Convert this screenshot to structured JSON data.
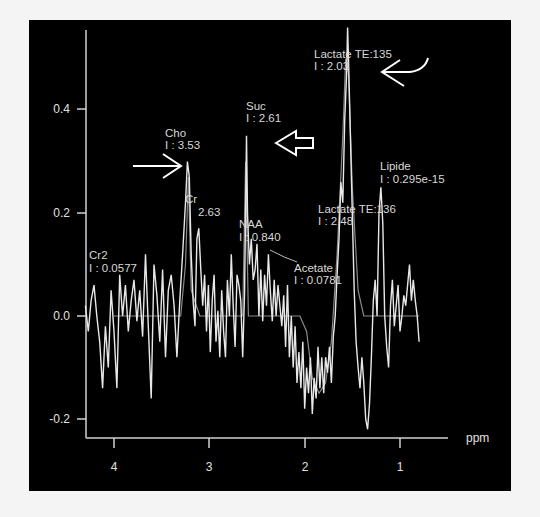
{
  "chart_data": {
    "type": "line",
    "title": "",
    "xlabel": "ppm",
    "ylabel": "",
    "x_reversed": true,
    "xlim": [
      4.3,
      0.5
    ],
    "ylim": [
      -0.24,
      0.55
    ],
    "grid": false,
    "xticks": [
      4,
      3,
      2,
      1
    ],
    "yticks": [
      0.4,
      0.2,
      0.0,
      -0.2
    ],
    "ytick_labels": [
      "0.4",
      "0.2",
      "0.0",
      "-0.2"
    ],
    "xtick_labels": [
      "4",
      "3",
      "2",
      "1"
    ],
    "series": [
      {
        "name": "measured spectrum",
        "color": "#e8e8e8",
        "points": [
          [
            4.3,
            0.02
          ],
          [
            4.27,
            -0.03
          ],
          [
            4.24,
            0.03
          ],
          [
            4.21,
            0.06
          ],
          [
            4.18,
            0.0
          ],
          [
            4.15,
            -0.05
          ],
          [
            4.12,
            -0.14
          ],
          [
            4.09,
            -0.02
          ],
          [
            4.06,
            -0.1
          ],
          [
            4.03,
            0.05
          ],
          [
            4.0,
            -0.03
          ],
          [
            3.97,
            -0.14
          ],
          [
            3.94,
            0.08
          ],
          [
            3.91,
            0.0
          ],
          [
            3.88,
            0.06
          ],
          [
            3.85,
            -0.03
          ],
          [
            3.82,
            0.03
          ],
          [
            3.79,
            0.07
          ],
          [
            3.76,
            -0.01
          ],
          [
            3.73,
            0.05
          ],
          [
            3.7,
            -0.04
          ],
          [
            3.67,
            0.12
          ],
          [
            3.64,
            -0.02
          ],
          [
            3.61,
            -0.16
          ],
          [
            3.58,
            0.1
          ],
          [
            3.55,
            0.04
          ],
          [
            3.52,
            -0.05
          ],
          [
            3.49,
            0.09
          ],
          [
            3.46,
            -0.08
          ],
          [
            3.43,
            0.05
          ],
          [
            3.4,
            0.08
          ],
          [
            3.37,
            0.02
          ],
          [
            3.34,
            -0.08
          ],
          [
            3.31,
            0.03
          ],
          [
            3.28,
            0.12
          ],
          [
            3.25,
            0.22
          ],
          [
            3.23,
            0.3
          ],
          [
            3.21,
            0.27
          ],
          [
            3.19,
            0.12
          ],
          [
            3.17,
            0.03
          ],
          [
            3.15,
            -0.02
          ],
          [
            3.13,
            0.15
          ],
          [
            3.11,
            0.17
          ],
          [
            3.09,
            0.09
          ],
          [
            3.07,
            0.02
          ],
          [
            3.05,
            0.08
          ],
          [
            3.03,
            -0.03
          ],
          [
            3.01,
            0.06
          ],
          [
            2.99,
            -0.07
          ],
          [
            2.97,
            0.03
          ],
          [
            2.95,
            0.08
          ],
          [
            2.93,
            -0.05
          ],
          [
            2.91,
            0.01
          ],
          [
            2.89,
            -0.08
          ],
          [
            2.87,
            0.05
          ],
          [
            2.85,
            -0.03
          ],
          [
            2.83,
            -0.08
          ],
          [
            2.81,
            0.07
          ],
          [
            2.79,
            0.0
          ],
          [
            2.77,
            0.12
          ],
          [
            2.75,
            0.02
          ],
          [
            2.73,
            -0.06
          ],
          [
            2.71,
            0.08
          ],
          [
            2.69,
            0.06
          ],
          [
            2.67,
            0.03
          ],
          [
            2.65,
            -0.08
          ],
          [
            2.63,
            0.05
          ],
          [
            2.61,
            0.35
          ],
          [
            2.6,
            0.2
          ],
          [
            2.58,
            0.1
          ],
          [
            2.56,
            0.15
          ],
          [
            2.54,
            0.07
          ],
          [
            2.52,
            0.09
          ],
          [
            2.5,
            0.14
          ],
          [
            2.48,
            0.0
          ],
          [
            2.46,
            0.09
          ],
          [
            2.44,
            -0.01
          ],
          [
            2.42,
            0.08
          ],
          [
            2.4,
            0.02
          ],
          [
            2.38,
            0.12
          ],
          [
            2.36,
            0.05
          ],
          [
            2.34,
            -0.01
          ],
          [
            2.32,
            0.07
          ],
          [
            2.3,
            0.0
          ],
          [
            2.28,
            0.06
          ],
          [
            2.26,
            0.02
          ],
          [
            2.24,
            -0.02
          ],
          [
            2.22,
            0.04
          ],
          [
            2.2,
            -0.06
          ],
          [
            2.18,
            0.06
          ],
          [
            2.16,
            -0.08
          ],
          [
            2.14,
            0.0
          ],
          [
            2.12,
            -0.1
          ],
          [
            2.1,
            -0.02
          ],
          [
            2.08,
            -0.13
          ],
          [
            2.06,
            -0.07
          ],
          [
            2.04,
            -0.14
          ],
          [
            2.02,
            -0.05
          ],
          [
            2.0,
            -0.18
          ],
          [
            1.98,
            -0.1
          ],
          [
            1.96,
            -0.15
          ],
          [
            1.94,
            -0.08
          ],
          [
            1.92,
            -0.19
          ],
          [
            1.9,
            -0.12
          ],
          [
            1.88,
            -0.16
          ],
          [
            1.86,
            -0.06
          ],
          [
            1.84,
            -0.14
          ],
          [
            1.82,
            -0.08
          ],
          [
            1.8,
            -0.15
          ],
          [
            1.78,
            -0.08
          ],
          [
            1.76,
            -0.11
          ],
          [
            1.74,
            -0.06
          ],
          [
            1.72,
            -0.13
          ],
          [
            1.7,
            -0.04
          ],
          [
            1.68,
            0.0
          ],
          [
            1.66,
            0.08
          ],
          [
            1.64,
            0.15
          ],
          [
            1.62,
            0.26
          ],
          [
            1.6,
            0.22
          ],
          [
            1.58,
            0.38
          ],
          [
            1.56,
            0.47
          ],
          [
            1.55,
            0.56
          ],
          [
            1.54,
            0.5
          ],
          [
            1.52,
            0.35
          ],
          [
            1.5,
            0.2
          ],
          [
            1.48,
            0.05
          ],
          [
            1.46,
            -0.05
          ],
          [
            1.44,
            -0.1
          ],
          [
            1.42,
            -0.14
          ],
          [
            1.4,
            -0.08
          ],
          [
            1.38,
            -0.13
          ],
          [
            1.36,
            -0.2
          ],
          [
            1.34,
            -0.22
          ],
          [
            1.32,
            -0.17
          ],
          [
            1.3,
            -0.08
          ],
          [
            1.28,
            0.03
          ],
          [
            1.26,
            0.07
          ],
          [
            1.24,
            0.0
          ],
          [
            1.22,
            0.2
          ],
          [
            1.2,
            0.25
          ],
          [
            1.18,
            0.18
          ],
          [
            1.16,
            0.0
          ],
          [
            1.14,
            -0.06
          ],
          [
            1.12,
            -0.1
          ],
          [
            1.1,
            0.02
          ],
          [
            1.08,
            0.07
          ],
          [
            1.06,
            -0.02
          ],
          [
            1.04,
            0.02
          ],
          [
            1.02,
            0.06
          ],
          [
            1.0,
            -0.03
          ],
          [
            0.98,
            0.0
          ],
          [
            0.96,
            0.04
          ],
          [
            0.94,
            0.02
          ],
          [
            0.92,
            0.06
          ],
          [
            0.9,
            0.1
          ],
          [
            0.88,
            0.03
          ],
          [
            0.86,
            0.07
          ],
          [
            0.84,
            0.03
          ],
          [
            0.82,
            0.0
          ],
          [
            0.8,
            -0.05
          ]
        ]
      },
      {
        "name": "fitted baseline",
        "color": "#8a8a8a",
        "points": [
          [
            4.0,
            0.0
          ],
          [
            3.3,
            0.0
          ],
          [
            3.25,
            0.1
          ],
          [
            3.22,
            0.27
          ],
          [
            3.19,
            0.05
          ],
          [
            3.1,
            0.0
          ],
          [
            2.65,
            0.0
          ],
          [
            2.62,
            0.3
          ],
          [
            2.59,
            0.0
          ],
          [
            2.3,
            0.0
          ],
          [
            2.05,
            0.0
          ],
          [
            1.98,
            -0.03
          ],
          [
            1.92,
            -0.12
          ],
          [
            1.85,
            -0.15
          ],
          [
            1.78,
            -0.13
          ],
          [
            1.72,
            -0.05
          ],
          [
            1.66,
            0.12
          ],
          [
            1.6,
            0.35
          ],
          [
            1.57,
            0.5
          ],
          [
            1.54,
            0.47
          ],
          [
            1.5,
            0.25
          ],
          [
            1.44,
            0.05
          ],
          [
            1.38,
            0.0
          ],
          [
            0.8,
            0.0
          ]
        ]
      }
    ],
    "annotations": [
      {
        "name": "Cho",
        "value": "I : 3.53",
        "ppm": 3.22
      },
      {
        "name": "Cr",
        "value": "2.63",
        "ppm": 3.15
      },
      {
        "name": "Cr2",
        "value": "I : 0.0577",
        "ppm": 4.2
      },
      {
        "name": "Suc",
        "value": "I : 2.61",
        "ppm": 2.61
      },
      {
        "name": "NAA",
        "value": "I : 0.840",
        "ppm": 2.35
      },
      {
        "name": "Acetate",
        "value": "I : 0.0781",
        "ppm": 2.0
      },
      {
        "name": "Lactate TE:135",
        "value": "I : 2.03",
        "ppm": 1.55
      },
      {
        "name": "Lipide",
        "value": "I : 0.295e-15",
        "ppm": 1.45
      },
      {
        "name": "Lactate TE:136",
        "value": "I : 2.48",
        "ppm": 1.3
      }
    ]
  },
  "labels": {
    "cho_name": "Cho",
    "cho_val": "I : 3.53",
    "cr_name": "Cr",
    "cr_val": "2.63",
    "cr2_name": "Cr2",
    "cr2_val": "I : 0.0577",
    "suc_name": "Suc",
    "suc_val": "I : 2.61",
    "naa_name": "NAA",
    "naa_val": "I : 0.840",
    "acetate_name": "Acetate",
    "acetate_val": "I : 0.0781",
    "lac135_name": "Lactate TE:135",
    "lac135_val": "I : 2.03",
    "lipide_name": "Lipide",
    "lipide_val": "I : 0.295e-15",
    "lac136_name": "Lactate TE:136",
    "lac136_val": "I : 2.48"
  },
  "axis": {
    "x_unit": "ppm",
    "y_ticks": [
      "0.4",
      "0.2",
      "0.0",
      "-0.2"
    ],
    "x_ticks": [
      "4",
      "3",
      "2",
      "1"
    ]
  },
  "colors": {
    "background": "#000000",
    "trace": "#e8e8e8",
    "fit": "#8a8a8a",
    "axis": "#d0d0d0",
    "text": "#d8d8d8",
    "page": "#f4f4f4"
  }
}
